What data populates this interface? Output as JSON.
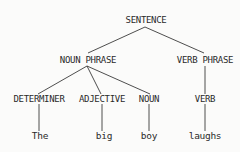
{
  "diagram": {
    "type": "parse-tree",
    "line_color": "#3a3a3a",
    "nodes": {
      "sentence": "SENTENCE",
      "noun_phrase": "NOUN PHRASE",
      "verb_phrase": "VERB PHRASE",
      "determiner": "DETERMINER",
      "adjective": "ADJECTIVE",
      "noun": "NOUN",
      "verb": "VERB"
    },
    "leaves": {
      "the": "The",
      "big": "big",
      "boy": "boy",
      "laughs": "laughs"
    },
    "edges": [
      [
        "SENTENCE",
        "NOUN PHRASE"
      ],
      [
        "SENTENCE",
        "VERB PHRASE"
      ],
      [
        "NOUN PHRASE",
        "DETERMINER"
      ],
      [
        "NOUN PHRASE",
        "ADJECTIVE"
      ],
      [
        "NOUN PHRASE",
        "NOUN"
      ],
      [
        "VERB PHRASE",
        "VERB"
      ],
      [
        "DETERMINER",
        "The"
      ],
      [
        "ADJECTIVE",
        "big"
      ],
      [
        "NOUN",
        "boy"
      ],
      [
        "VERB",
        "laughs"
      ]
    ]
  }
}
